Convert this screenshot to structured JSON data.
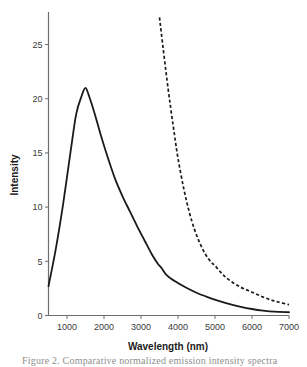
{
  "figure": {
    "caption": "Figure 2. Comparative normalized emission intensity spectra"
  },
  "chart_data": {
    "type": "line",
    "title": "",
    "xlabel": "Wavelength (nm)",
    "ylabel": "Intensity",
    "xlim": [
      500,
      7000
    ],
    "ylim": [
      0,
      28
    ],
    "grid": false,
    "legend": "none",
    "xticks": [
      1000,
      2000,
      3000,
      4000,
      5000,
      6000,
      7000
    ],
    "xtick_labels": [
      "1000",
      "2000",
      "3000",
      "4000",
      "5000",
      "6000",
      "7000"
    ],
    "yticks": [
      0,
      5,
      10,
      15,
      20,
      25
    ],
    "ytick_labels": [
      "0",
      "5",
      "10",
      "15",
      "20",
      "25"
    ],
    "series": [
      {
        "name": "solid-curve",
        "style": "solid",
        "color": "#1a1a1a",
        "x": [
          500,
          700,
          900,
          1100,
          1250,
          1400,
          1500,
          1600,
          1750,
          1900,
          2100,
          2300,
          2500,
          2700,
          2900,
          3100,
          3300,
          3450,
          3550,
          3700,
          3900,
          4200,
          4500,
          4800,
          5100,
          5400,
          5700,
          6000,
          6300,
          6600,
          7000
        ],
        "y": [
          2.7,
          6.2,
          10.4,
          15.2,
          18.6,
          20.3,
          21.0,
          20.2,
          18.6,
          16.8,
          14.6,
          12.6,
          11.0,
          9.6,
          8.2,
          6.9,
          5.6,
          4.8,
          4.4,
          3.7,
          3.2,
          2.6,
          2.1,
          1.7,
          1.35,
          1.05,
          0.8,
          0.6,
          0.45,
          0.35,
          0.3
        ]
      },
      {
        "name": "dashed-curve",
        "style": "dashed",
        "color": "#1a1a1a",
        "x": [
          3500,
          3600,
          3700,
          3800,
          3900,
          4000,
          4150,
          4300,
          4450,
          4600,
          4750,
          4900,
          5000,
          5150,
          5300,
          5500,
          5700,
          5900,
          6100,
          6300,
          6500,
          6700,
          7000
        ],
        "y": [
          27.5,
          24.6,
          21.8,
          19.2,
          16.8,
          14.5,
          11.8,
          9.6,
          7.9,
          6.6,
          5.6,
          4.9,
          4.6,
          4.0,
          3.5,
          3.0,
          2.6,
          2.3,
          2.0,
          1.7,
          1.45,
          1.25,
          1.0
        ]
      }
    ]
  }
}
